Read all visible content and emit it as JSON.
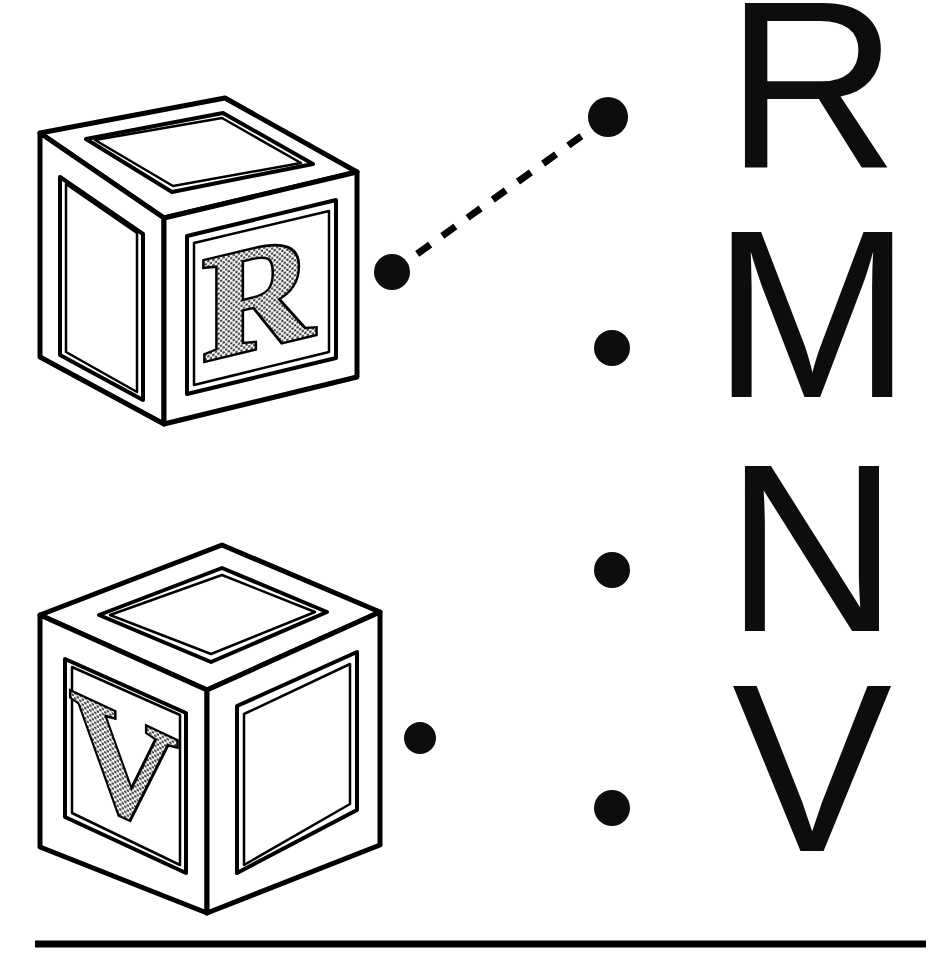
{
  "page": {
    "background_color": "#ffffff",
    "ink_color": "#000000",
    "width": 934,
    "height": 955
  },
  "blocks": [
    {
      "id": "block-r",
      "letter": "R",
      "letter_fill": "#b5b5b5",
      "orientation": "front-right-face",
      "position": {
        "x": 38,
        "y": 118,
        "width": 322,
        "height": 312
      }
    },
    {
      "id": "block-v",
      "letter": "V",
      "letter_fill": "#b5b5b5",
      "orientation": "front-left-face",
      "position": {
        "x": 38,
        "y": 545,
        "width": 345,
        "height": 375
      }
    }
  ],
  "left_dots": [
    {
      "id": "left-dot-r",
      "cx": 392,
      "cy": 272,
      "r": 18,
      "linked_to": "right-dot-1"
    },
    {
      "id": "left-dot-v",
      "cx": 420,
      "cy": 738,
      "r": 16,
      "linked_to": null
    }
  ],
  "right_dots": [
    {
      "id": "right-dot-1",
      "cx": 608,
      "cy": 117,
      "r": 20,
      "letter": "R"
    },
    {
      "id": "right-dot-2",
      "cx": 612,
      "cy": 348,
      "r": 18,
      "letter": "M"
    },
    {
      "id": "right-dot-3",
      "cx": 612,
      "cy": 570,
      "r": 18,
      "letter": "N"
    },
    {
      "id": "right-dot-4",
      "cx": 612,
      "cy": 808,
      "r": 18,
      "letter": "V"
    }
  ],
  "connector": {
    "id": "connector-r",
    "style": "dashed",
    "from": {
      "x": 392,
      "y": 272
    },
    "to": {
      "x": 608,
      "y": 117
    },
    "dash": "16 14",
    "stroke_width": 7,
    "color": "#000000"
  },
  "letters": [
    {
      "index": 0,
      "char": "R"
    },
    {
      "index": 1,
      "char": "M"
    },
    {
      "index": 2,
      "char": "N"
    },
    {
      "index": 3,
      "char": "V"
    }
  ],
  "footer_rule": {
    "x1": 35,
    "x2": 926,
    "y": 944,
    "thickness": 6,
    "color": "#000000"
  }
}
